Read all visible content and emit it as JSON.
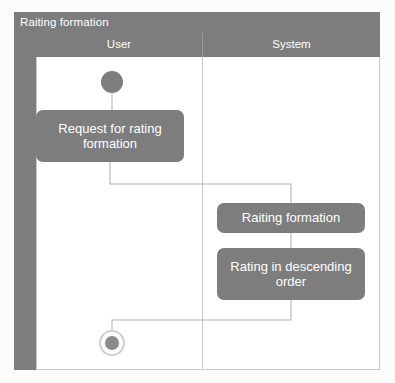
{
  "diagram": {
    "title": "Raiting formation",
    "type": "uml-activity-diagram",
    "lanes": [
      {
        "name": "User",
        "label": "User"
      },
      {
        "name": "System",
        "label": "System"
      }
    ],
    "nodes": [
      {
        "id": "start",
        "kind": "initial-node",
        "lane": "User",
        "label": ""
      },
      {
        "id": "request",
        "kind": "action",
        "lane": "User",
        "label": "Request for rating formation"
      },
      {
        "id": "raiting",
        "kind": "action",
        "lane": "System",
        "label": "Raiting formation"
      },
      {
        "id": "descend",
        "kind": "action",
        "lane": "System",
        "label": "Rating in descending order"
      },
      {
        "id": "end",
        "kind": "final-node",
        "lane": "User",
        "label": ""
      }
    ],
    "edges": [
      {
        "from": "start",
        "to": "request"
      },
      {
        "from": "request",
        "to": "raiting"
      },
      {
        "from": "raiting",
        "to": "descend"
      },
      {
        "from": "descend",
        "to": "end"
      }
    ],
    "colors": {
      "node_fill": "#7d7d7d",
      "node_text": "#ffffff",
      "header_fill": "#7d7d7d",
      "frame_border": "#c9c9c9",
      "edge_line": "#b5b5b5",
      "lane_background": "#ffffff",
      "page_background": "#fbfbfa",
      "final_node_ring": "#cfcfcf"
    }
  }
}
